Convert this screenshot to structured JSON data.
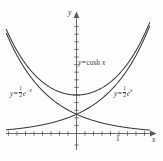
{
  "chart_data": {
    "type": "line",
    "title": "",
    "xlabel": "x",
    "ylabel": "y",
    "xlim": [
      -2.0,
      2.0
    ],
    "ylim": [
      -0.6,
      3.1
    ],
    "grid": false,
    "legend": "inline-annotations",
    "axis_origin_label": "",
    "x_tick_labels": [
      "1"
    ],
    "x_tick_values": [
      1
    ],
    "y_tick_values": [
      1
    ],
    "y_tick_labels": [],
    "tick_interval": 0.2,
    "series": [
      {
        "name": "y = cosh x",
        "formula": "cosh(x)",
        "points_x": [
          -2.0,
          -1.8,
          -1.6,
          -1.4,
          -1.2,
          -1.0,
          -0.8,
          -0.6,
          -0.4,
          -0.2,
          0.0,
          0.2,
          0.4,
          0.6,
          0.8,
          1.0,
          1.2,
          1.4,
          1.6,
          1.8,
          2.0
        ],
        "points_y": [
          3.762,
          3.107,
          2.577,
          2.151,
          1.811,
          1.543,
          1.337,
          1.185,
          1.081,
          1.02,
          1.0,
          1.02,
          1.081,
          1.185,
          1.337,
          1.543,
          1.811,
          2.151,
          2.577,
          3.107,
          3.762
        ]
      },
      {
        "name": "y = 1/2 e^{-x}",
        "formula": "0.5*exp(-x)",
        "points_x": [
          -2.0,
          -1.8,
          -1.6,
          -1.4,
          -1.2,
          -1.0,
          -0.8,
          -0.6,
          -0.4,
          -0.2,
          0.0,
          0.2,
          0.4,
          0.6,
          0.8,
          1.0,
          1.2,
          1.4,
          1.6,
          1.8,
          2.0
        ],
        "points_y": [
          3.695,
          3.025,
          2.476,
          2.027,
          1.66,
          1.359,
          1.113,
          0.911,
          0.746,
          0.611,
          0.5,
          0.409,
          0.335,
          0.274,
          0.225,
          0.184,
          0.151,
          0.123,
          0.101,
          0.083,
          0.068
        ]
      },
      {
        "name": "y = 1/2 e^{x}",
        "formula": "0.5*exp(x)",
        "points_x": [
          -2.0,
          -1.8,
          -1.6,
          -1.4,
          -1.2,
          -1.0,
          -0.8,
          -0.6,
          -0.4,
          -0.2,
          0.0,
          0.2,
          0.4,
          0.6,
          0.8,
          1.0,
          1.2,
          1.4,
          1.6,
          1.8,
          2.0
        ],
        "points_y": [
          0.068,
          0.083,
          0.101,
          0.123,
          0.151,
          0.184,
          0.225,
          0.274,
          0.335,
          0.409,
          0.5,
          0.611,
          0.746,
          0.911,
          1.113,
          1.359,
          1.66,
          2.027,
          2.476,
          3.025,
          3.695
        ]
      }
    ],
    "annotations": [
      {
        "id": "cosh",
        "text_prefix": "y",
        "operator": "=",
        "body": "cosh",
        "variable": "x"
      },
      {
        "id": "neg-exp",
        "text_prefix": "y",
        "operator": "=",
        "numerator": "1",
        "denominator": "2",
        "base": "e",
        "exponent": "−x"
      },
      {
        "id": "pos-exp",
        "text_prefix": "y",
        "operator": "=",
        "numerator": "1",
        "denominator": "2",
        "base": "e",
        "exponent": "x"
      }
    ],
    "colors": {
      "curve": "#3c3c3c",
      "axis": "#5a5a5a",
      "background": "#fdfdfd",
      "text": "#3c3c3c"
    }
  },
  "axes": {
    "y_axis_label": "y",
    "x_axis_label": "x",
    "x_tick_one": "1"
  },
  "labels": {
    "cosh": {
      "lhs": "y",
      "eq": "=",
      "fn": "cosh",
      "arg": "x"
    },
    "neg_exp": {
      "lhs": "y",
      "eq": "=",
      "num": "1",
      "den": "2",
      "base": "e",
      "exp": "−x"
    },
    "pos_exp": {
      "lhs": "y",
      "eq": "=",
      "num": "1",
      "den": "2",
      "base": "e",
      "exp": "x"
    }
  }
}
